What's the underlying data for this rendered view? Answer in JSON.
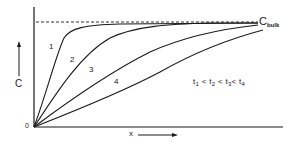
{
  "diagram": {
    "y_axis_label": "C",
    "x_axis_label": "x",
    "origin_label": "0",
    "bulk_label": {
      "main": "C",
      "subscript": "bulk"
    },
    "curve_labels": [
      "1",
      "2",
      "3",
      "4"
    ],
    "inequality": {
      "t1": "t",
      "s1": "1",
      "lt1": " < ",
      "t2": "t",
      "s2": "2",
      "lt2": " < ",
      "t3": "t",
      "s3": "3",
      "lt3": "< ",
      "t4": "t",
      "s4": "4"
    },
    "line_color": "#1a1a1a",
    "background": "#ffffff"
  }
}
